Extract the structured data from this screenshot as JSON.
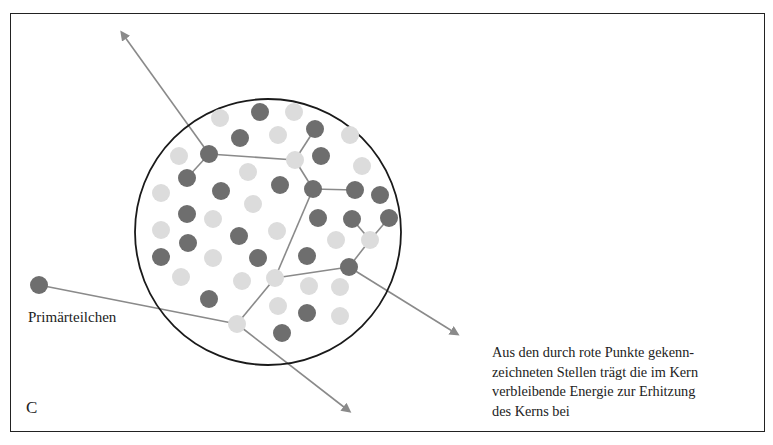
{
  "figure": {
    "panel_label": "C",
    "labels": {
      "primary_particle": "Primärteilchen"
    },
    "caption_lines": [
      "Aus den durch rote Punkte gekenn-",
      "zeichneten Stellen trägt die im Kern",
      "verbleibende Energie zur Erhitzung",
      "des Kerns bei"
    ],
    "colors": {
      "frame": "#222222",
      "nucleus_outline": "#1a1a1a",
      "dark_nucleon": "#6e6e6e",
      "light_nucleon": "#dcdcdc",
      "track": "#8a8a8a"
    },
    "nucleus": {
      "cx": 268,
      "cy": 232,
      "r": 133
    },
    "dark_nucleons": [
      [
        260,
        112
      ],
      [
        240,
        138
      ],
      [
        315,
        129
      ],
      [
        209,
        154
      ],
      [
        321,
        156
      ],
      [
        187,
        178
      ],
      [
        280,
        185
      ],
      [
        221,
        191
      ],
      [
        313,
        189
      ],
      [
        355,
        190
      ],
      [
        380,
        195
      ],
      [
        187,
        214
      ],
      [
        318,
        218
      ],
      [
        352,
        219
      ],
      [
        389,
        218
      ],
      [
        188,
        243
      ],
      [
        239,
        236
      ],
      [
        161,
        257
      ],
      [
        307,
        256
      ],
      [
        258,
        258
      ],
      [
        349,
        267
      ],
      [
        209,
        299
      ],
      [
        307,
        313
      ],
      [
        282,
        333
      ],
      [
        39,
        285
      ]
    ],
    "light_nucleons": [
      [
        220,
        118
      ],
      [
        294,
        112
      ],
      [
        350,
        135
      ],
      [
        179,
        156
      ],
      [
        278,
        135
      ],
      [
        295,
        160
      ],
      [
        362,
        166
      ],
      [
        161,
        193
      ],
      [
        248,
        172
      ],
      [
        253,
        204
      ],
      [
        213,
        219
      ],
      [
        161,
        230
      ],
      [
        277,
        231
      ],
      [
        336,
        240
      ],
      [
        370,
        240
      ],
      [
        213,
        258
      ],
      [
        181,
        277
      ],
      [
        242,
        281
      ],
      [
        275,
        278
      ],
      [
        309,
        286
      ],
      [
        340,
        287
      ],
      [
        278,
        306
      ],
      [
        340,
        316
      ],
      [
        237,
        324
      ]
    ],
    "tracks": [
      {
        "from": [
          39,
          285
        ],
        "to": [
          237,
          324
        ],
        "arrow": false
      },
      {
        "from": [
          237,
          324
        ],
        "to": [
          349,
          411
        ],
        "arrow": true
      },
      {
        "from": [
          237,
          324
        ],
        "to": [
          275,
          278
        ],
        "arrow": false
      },
      {
        "from": [
          275,
          278
        ],
        "to": [
          313,
          189
        ],
        "arrow": false
      },
      {
        "from": [
          275,
          278
        ],
        "to": [
          349,
          267
        ],
        "arrow": false
      },
      {
        "from": [
          349,
          267
        ],
        "to": [
          370,
          240
        ],
        "arrow": false
      },
      {
        "from": [
          370,
          240
        ],
        "to": [
          352,
          219
        ],
        "arrow": false
      },
      {
        "from": [
          370,
          240
        ],
        "to": [
          389,
          218
        ],
        "arrow": false
      },
      {
        "from": [
          349,
          267
        ],
        "to": [
          457,
          334
        ],
        "arrow": true
      },
      {
        "from": [
          313,
          189
        ],
        "to": [
          355,
          190
        ],
        "arrow": false
      },
      {
        "from": [
          313,
          189
        ],
        "to": [
          295,
          160
        ],
        "arrow": false
      },
      {
        "from": [
          295,
          160
        ],
        "to": [
          315,
          129
        ],
        "arrow": false
      },
      {
        "from": [
          295,
          160
        ],
        "to": [
          209,
          154
        ],
        "arrow": false
      },
      {
        "from": [
          209,
          154
        ],
        "to": [
          187,
          178
        ],
        "arrow": false
      },
      {
        "from": [
          209,
          154
        ],
        "to": [
          122,
          33
        ],
        "arrow": true
      }
    ]
  }
}
